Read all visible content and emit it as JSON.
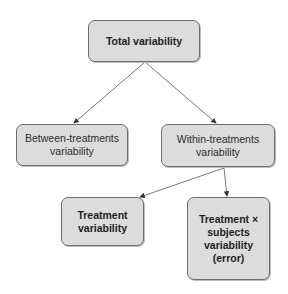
{
  "diagram": {
    "nodes": [
      {
        "id": "total",
        "lines": [
          "Total variability"
        ],
        "bold": true
      },
      {
        "id": "between",
        "lines": [
          "Between-treatments",
          "variability"
        ],
        "bold": false
      },
      {
        "id": "within",
        "lines": [
          "Within-treatments",
          "variability"
        ],
        "bold": false
      },
      {
        "id": "treatment",
        "lines": [
          "Treatment",
          "variability"
        ],
        "bold": true
      },
      {
        "id": "error",
        "lines": [
          "Treatment ×",
          "subjects",
          "variability",
          "(error)"
        ],
        "bold": true
      }
    ],
    "edges": [
      {
        "from": "total",
        "to": "between"
      },
      {
        "from": "total",
        "to": "within"
      },
      {
        "from": "within",
        "to": "treatment"
      },
      {
        "from": "within",
        "to": "error"
      }
    ],
    "colors": {
      "box_fill": "#dcdcdc",
      "box_border": "#6e6e6e",
      "arrow": "#444444"
    }
  }
}
